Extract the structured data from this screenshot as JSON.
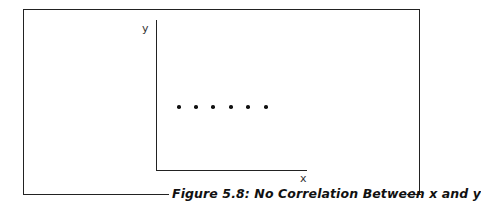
{
  "figure": {
    "caption": "Figure 5.8: No Correlation Between x and y"
  },
  "chart_data": {
    "type": "scatter",
    "title": "Figure 5.8: No Correlation Between x and y",
    "xlabel": "x",
    "ylabel": "y",
    "grid": false,
    "legend": null,
    "x": [
      1,
      2,
      3,
      4,
      5,
      6
    ],
    "y": [
      5,
      5,
      5,
      5,
      5,
      5
    ],
    "points_px": [
      [
        179,
        107
      ],
      [
        196,
        107
      ],
      [
        213,
        107
      ],
      [
        231,
        107
      ],
      [
        248,
        107
      ],
      [
        266,
        107
      ]
    ],
    "note": "Six points at equal y (horizontal line) — no ticks or numeric labels shown"
  }
}
